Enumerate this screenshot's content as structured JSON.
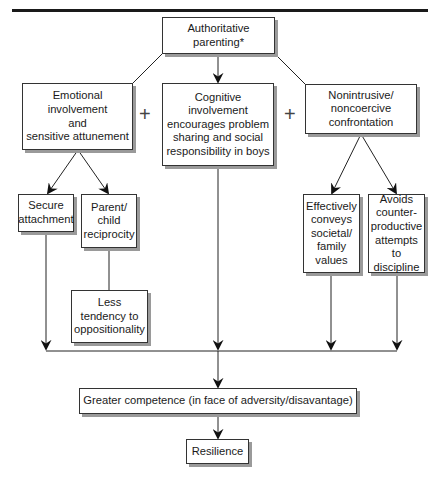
{
  "diagram": {
    "nodes": {
      "root": "Authoritative\nparenting*",
      "emotional": "Emotional\ninvolvement\nand\nsensitive attunement",
      "cognitive": "Cognitive\ninvolvement\nencourages problem\nsharing and social\nresponsibility in boys",
      "nonintrusive": "Nonintrusive/\nnoncoercive\nconfrontation",
      "secure": "Secure\nattachment",
      "reciprocity": "Parent/\nchild\nreciprocity",
      "less_opposition": "Less\ntendency to\noppositionality",
      "conveys_values": "Effectively\nconveys\nsocietal/\nfamily\nvalues",
      "avoids_discipline": "Avoids\ncounter-\nproductive\nattempts\nto discipline",
      "competence": "Greater competence (in face of adversity/disavantage)",
      "resilience": "Resilience"
    },
    "operators": {
      "plus_left": "+",
      "plus_right": "+"
    },
    "edges": [
      {
        "from": "root",
        "to": "emotional",
        "arrow": false
      },
      {
        "from": "root",
        "to": "cognitive",
        "arrow": true
      },
      {
        "from": "root",
        "to": "nonintrusive",
        "arrow": false
      },
      {
        "from": "emotional",
        "to": "secure",
        "arrow": true
      },
      {
        "from": "emotional",
        "to": "reciprocity",
        "arrow": true
      },
      {
        "from": "reciprocity",
        "to": "less_opposition",
        "arrow": false
      },
      {
        "from": "nonintrusive",
        "to": "conveys_values",
        "arrow": true
      },
      {
        "from": "nonintrusive",
        "to": "avoids_discipline",
        "arrow": true
      },
      {
        "from": "secure",
        "to": "merge-bar",
        "arrow": true
      },
      {
        "from": "cognitive",
        "to": "merge-bar",
        "arrow": true
      },
      {
        "from": "conveys_values",
        "to": "merge-bar",
        "arrow": true
      },
      {
        "from": "avoids_discipline",
        "to": "merge-bar",
        "arrow": true
      },
      {
        "from": "merge-bar",
        "to": "competence",
        "arrow": true
      },
      {
        "from": "competence",
        "to": "resilience",
        "arrow": true
      }
    ]
  }
}
